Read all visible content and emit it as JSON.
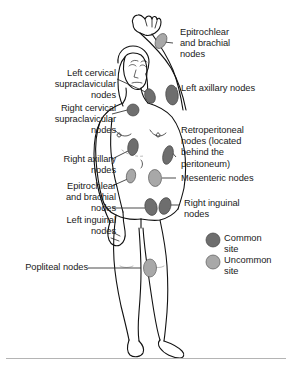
{
  "labels": {
    "epitrochlear_brachial_upper": "Epitrochlear\nand brachial\nnodes",
    "left_cervical": "Left cervical\nsupraclavicular\nnodes",
    "left_axillary": "Left axillary nodes",
    "right_cervical": "Right cervical\nsupraclavicular\nnodes",
    "retroperitoneal": "Retroperitoneal\nnodes (located\nbehind the\nperitoneum)",
    "right_axillary": "Right axillary\nnodes",
    "mesenteric": "Mesenteric nodes",
    "epitrochlear_brachial_lower": "Epitrochlear\nand brachial\nnodes",
    "right_inguinal": "Right inguinal\nnodes",
    "left_inguinal": "Left inguinal\nnodes",
    "popliteal": "Popliteal nodes"
  },
  "legend": {
    "common": "Common\nsite",
    "uncommon": "Uncommon\nsite"
  },
  "colors": {
    "common_site": "#6e6e6e",
    "uncommon_site": "#a8a8a8",
    "outline": "#111111",
    "text": "#1a1a1a",
    "leader": "#2b2b2b",
    "rule": "#b4b4b4",
    "background": "#ffffff"
  },
  "nodes": [
    {
      "id": "left-brachial-node",
      "label": "Epitrochlear and brachial nodes",
      "type": "uncommon"
    },
    {
      "id": "left-axillary-node",
      "label": "Left axillary nodes",
      "type": "common"
    },
    {
      "id": "left-cervical-node",
      "label": "Left cervical supraclavicular nodes",
      "type": "common"
    },
    {
      "id": "right-cervical-node",
      "label": "Right cervical supraclavicular nodes",
      "type": "common"
    },
    {
      "id": "right-axillary-node",
      "label": "Right axillary nodes",
      "type": "common"
    },
    {
      "id": "right-brachial-node",
      "label": "Epitrochlear and brachial nodes",
      "type": "uncommon"
    },
    {
      "id": "retroperitoneal-node",
      "label": "Retroperitoneal nodes",
      "type": "common"
    },
    {
      "id": "mesenteric-node",
      "label": "Mesenteric nodes",
      "type": "uncommon"
    },
    {
      "id": "right-inguinal-node",
      "label": "Right inguinal nodes",
      "type": "common"
    },
    {
      "id": "left-inguinal-node",
      "label": "Left inguinal nodes",
      "type": "common"
    },
    {
      "id": "popliteal-node",
      "label": "Popliteal nodes",
      "type": "uncommon"
    }
  ]
}
